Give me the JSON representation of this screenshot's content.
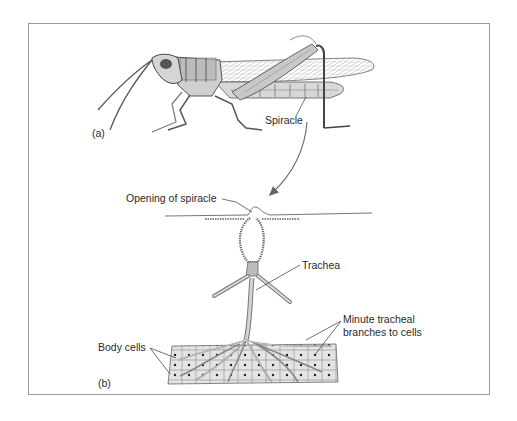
{
  "figure": {
    "panel_a": {
      "label": "(a)",
      "subject": "grasshopper",
      "callouts": {
        "spiracle": "Spiracle"
      }
    },
    "panel_b": {
      "label": "(b)",
      "callouts": {
        "opening_of_spiracle": "Opening of spiracle",
        "trachea": "Trachea",
        "minute_tracheal_line1": "Minute tracheal",
        "minute_tracheal_line2": "branches to cells",
        "body_cells": "Body cells"
      }
    },
    "colors": {
      "frame": "#9a9a9a",
      "ink": "#3a3a3a",
      "text": "#2a2a2a",
      "shade": "#bdbdbd"
    }
  }
}
